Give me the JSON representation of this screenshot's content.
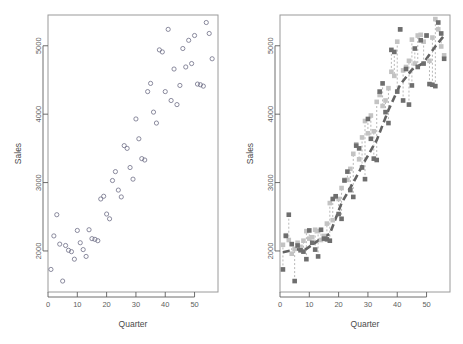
{
  "figure": {
    "title": "",
    "panel_count": 2,
    "background": "#ffffff"
  },
  "axis_titles": {
    "x": "Quarter",
    "y": "Sales"
  },
  "colors": {
    "open_circle_stroke": "#6f6f86",
    "square_dark": "#6e6e6e",
    "square_light": "#c3c3c3",
    "connector": "#9a9a9a",
    "trend_line": "#636363",
    "frame": "#9a9a9a",
    "tick_text": "#5e5e5e"
  },
  "chart_data": [
    {
      "type": "scatter",
      "panel": "left",
      "title": "",
      "xlabel": "Quarter",
      "ylabel": "Sales",
      "xlim": [
        0,
        58
      ],
      "ylim": [
        1400,
        5450
      ],
      "xticks": [
        0,
        10,
        20,
        30,
        40,
        50
      ],
      "yticks": [
        2000,
        3000,
        4000,
        5000
      ],
      "grid": false,
      "legend": "none",
      "marker": "open-circle",
      "series": [
        {
          "name": "Sales",
          "x": [
            1,
            2,
            3,
            4,
            5,
            6,
            7,
            8,
            9,
            10,
            11,
            12,
            13,
            14,
            15,
            16,
            17,
            18,
            19,
            20,
            21,
            22,
            23,
            24,
            25,
            26,
            27,
            28,
            29,
            30,
            31,
            32,
            33,
            34,
            35,
            36,
            37,
            38,
            39,
            40,
            41,
            42,
            43,
            44,
            45,
            46,
            47,
            48,
            49,
            50,
            51,
            52,
            53,
            54,
            55,
            56
          ],
          "y": [
            1730,
            2220,
            2530,
            2100,
            1560,
            2080,
            2010,
            1990,
            1880,
            2300,
            2120,
            2020,
            1920,
            2310,
            2180,
            2170,
            2150,
            2760,
            2800,
            2540,
            2470,
            3030,
            3160,
            2890,
            2790,
            3540,
            3500,
            3220,
            3050,
            3930,
            3640,
            3350,
            3330,
            4330,
            4450,
            4030,
            3870,
            4940,
            4910,
            4330,
            5240,
            4200,
            4660,
            4140,
            4420,
            4960,
            4690,
            5080,
            4740,
            5150,
            4440,
            4430,
            4410,
            5340,
            5180,
            4810
          ]
        }
      ]
    },
    {
      "type": "scatter",
      "panel": "right",
      "title": "",
      "xlabel": "Quarter",
      "ylabel": "Sales",
      "xlim": [
        0,
        58
      ],
      "ylim": [
        1400,
        5450
      ],
      "xticks": [
        0,
        10,
        20,
        30,
        40,
        50
      ],
      "yticks": [
        2000,
        3000,
        4000,
        5000
      ],
      "grid": false,
      "legend": "none",
      "series": [
        {
          "name": "Observed",
          "marker": "filled-square-dark",
          "x": [
            1,
            2,
            3,
            4,
            5,
            6,
            7,
            8,
            9,
            10,
            11,
            12,
            13,
            14,
            15,
            16,
            17,
            18,
            19,
            20,
            21,
            22,
            23,
            24,
            25,
            26,
            27,
            28,
            29,
            30,
            31,
            32,
            33,
            34,
            35,
            36,
            37,
            38,
            39,
            40,
            41,
            42,
            43,
            44,
            45,
            46,
            47,
            48,
            49,
            50,
            51,
            52,
            53,
            54,
            55,
            56
          ],
          "y": [
            1730,
            2220,
            2530,
            2100,
            1560,
            2080,
            2010,
            1990,
            1880,
            2300,
            2120,
            2020,
            1920,
            2310,
            2180,
            2170,
            2150,
            2760,
            2800,
            2540,
            2470,
            3030,
            3160,
            2890,
            2790,
            3540,
            3500,
            3220,
            3050,
            3930,
            3640,
            3350,
            3330,
            4330,
            4450,
            4030,
            3870,
            4940,
            4910,
            4330,
            5240,
            4200,
            4660,
            4140,
            4420,
            4960,
            4690,
            5080,
            4740,
            5150,
            4440,
            4430,
            4410,
            5340,
            5180,
            4810
          ]
        },
        {
          "name": "Fitted",
          "marker": "filled-square-light",
          "x": [
            1,
            2,
            3,
            4,
            5,
            6,
            7,
            8,
            9,
            10,
            11,
            12,
            13,
            14,
            15,
            16,
            17,
            18,
            19,
            20,
            21,
            22,
            23,
            24,
            25,
            26,
            27,
            28,
            29,
            30,
            31,
            32,
            33,
            34,
            35,
            36,
            37,
            38,
            39,
            40,
            41,
            42,
            43,
            44,
            45,
            46,
            47,
            48,
            49,
            50,
            51,
            52,
            53,
            54,
            55,
            56
          ],
          "y": [
            2090,
            2230,
            2160,
            1960,
            2030,
            2120,
            2060,
            2150,
            2290,
            2180,
            2200,
            2310,
            2290,
            2160,
            2220,
            2400,
            2700,
            2450,
            2790,
            2760,
            2920,
            3040,
            3040,
            3200,
            3420,
            3560,
            3340,
            3660,
            3900,
            3720,
            3980,
            3750,
            4180,
            4280,
            4120,
            4200,
            4380,
            4620,
            4560,
            5060,
            5240,
            4640,
            4690,
            4780,
            5090,
            4740,
            5150,
            5160,
            5060,
            5150,
            4780,
            5120,
            5390,
            5240,
            4990,
            4860
          ]
        },
        {
          "name": "Trend",
          "marker": "dashed-line",
          "x": [
            1,
            5,
            9,
            13,
            17,
            21,
            25,
            29,
            33,
            37,
            41,
            45,
            49,
            53,
            56
          ],
          "y": [
            1980,
            2020,
            2030,
            2150,
            2250,
            2700,
            3000,
            3320,
            3620,
            4060,
            4430,
            4650,
            4750,
            4990,
            5150
          ]
        }
      ]
    }
  ]
}
